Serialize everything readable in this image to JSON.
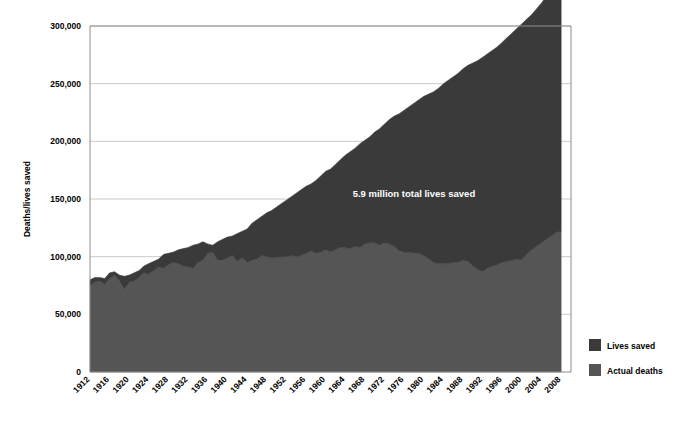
{
  "chart_data": {
    "type": "area",
    "stacked": true,
    "title": "",
    "subtitle": "",
    "xlabel": "",
    "ylabel": "Deaths/lives saved",
    "ylim": [
      0,
      300000
    ],
    "ytick_values": [
      0,
      50000,
      100000,
      150000,
      200000,
      250000,
      300000
    ],
    "ytick_labels": [
      "0",
      "50,000",
      "100,000",
      "150,000",
      "200,000",
      "250,000",
      "300,000"
    ],
    "grid": "horizontal",
    "xlim": [
      1912,
      2010
    ],
    "xtick_labels": [
      "1912",
      "1916",
      "1920",
      "1924",
      "1928",
      "1932",
      "1936",
      "1940",
      "1944",
      "1948",
      "1952",
      "1956",
      "1960",
      "1964",
      "1968",
      "1972",
      "1976",
      "1980",
      "1984",
      "1988",
      "1992",
      "1996",
      "2000",
      "2004",
      "2008"
    ],
    "xtick_values": [
      1912,
      1916,
      1920,
      1924,
      1928,
      1932,
      1936,
      1940,
      1944,
      1948,
      1952,
      1956,
      1960,
      1964,
      1968,
      1972,
      1976,
      1980,
      1984,
      1988,
      1992,
      1996,
      2000,
      2004,
      2008
    ],
    "legend_position": "right",
    "annotations": [
      {
        "text": "5.9 million total lives saved",
        "x": 1978,
        "y": 152000,
        "color": "#ffffff"
      }
    ],
    "x": [
      1912,
      1913,
      1914,
      1915,
      1916,
      1917,
      1918,
      1919,
      1920,
      1921,
      1922,
      1923,
      1924,
      1925,
      1926,
      1927,
      1928,
      1929,
      1930,
      1931,
      1932,
      1933,
      1934,
      1935,
      1936,
      1937,
      1938,
      1939,
      1940,
      1941,
      1942,
      1943,
      1944,
      1945,
      1946,
      1947,
      1948,
      1949,
      1950,
      1951,
      1952,
      1953,
      1954,
      1955,
      1956,
      1957,
      1958,
      1959,
      1960,
      1961,
      1962,
      1963,
      1964,
      1965,
      1966,
      1967,
      1968,
      1969,
      1970,
      1971,
      1972,
      1973,
      1974,
      1975,
      1976,
      1977,
      1978,
      1979,
      1980,
      1981,
      1982,
      1983,
      1984,
      1985,
      1986,
      1987,
      1988,
      1989,
      1990,
      1991,
      1992,
      1993,
      1994,
      1995,
      1996,
      1997,
      1998,
      1999,
      2000,
      2001,
      2002,
      2003,
      2004,
      2005,
      2006,
      2007,
      2008
    ],
    "series": [
      {
        "name": "Actual deaths",
        "color": "#555555",
        "values": [
          75000,
          78000,
          79000,
          76000,
          81000,
          84000,
          79000,
          72000,
          78000,
          79000,
          82000,
          86000,
          85000,
          88000,
          91000,
          90000,
          93000,
          95000,
          94000,
          92000,
          91000,
          90000,
          95000,
          97000,
          103000,
          104000,
          97000,
          97000,
          99000,
          101000,
          96000,
          99000,
          95000,
          97000,
          98000,
          101000,
          100000,
          99000,
          99000,
          100000,
          100000,
          101000,
          100000,
          101000,
          103000,
          105000,
          103000,
          104000,
          106000,
          104000,
          106000,
          108000,
          108000,
          107000,
          109000,
          108000,
          111000,
          112000,
          112000,
          110000,
          112000,
          111000,
          109000,
          105000,
          104000,
          104000,
          103000,
          103000,
          101000,
          98000,
          95000,
          94000,
          94000,
          94000,
          95000,
          95000,
          97000,
          96000,
          92000,
          89000,
          87000,
          90000,
          92000,
          93000,
          95000,
          96000,
          97000,
          98000,
          98000,
          102000,
          106000,
          109000,
          112000,
          115000,
          118000,
          121000,
          122000
        ]
      },
      {
        "name": "Lives saved",
        "color": "#3a3a3a",
        "values": [
          5000,
          4000,
          3000,
          5000,
          5000,
          3000,
          5000,
          11000,
          6000,
          7000,
          6000,
          6000,
          9000,
          8000,
          7000,
          12000,
          10000,
          9000,
          12000,
          15000,
          17000,
          20000,
          16000,
          16000,
          8000,
          6000,
          16000,
          18000,
          18000,
          17000,
          24000,
          23000,
          29000,
          32000,
          34000,
          34000,
          38000,
          41000,
          44000,
          46000,
          49000,
          51000,
          55000,
          57000,
          58000,
          58000,
          63000,
          66000,
          68000,
          72000,
          74000,
          76000,
          80000,
          84000,
          85000,
          90000,
          90000,
          92000,
          96000,
          101000,
          103000,
          108000,
          113000,
          119000,
          123000,
          126000,
          130000,
          133000,
          138000,
          143000,
          148000,
          152000,
          156000,
          159000,
          161000,
          164000,
          166000,
          170000,
          176000,
          181000,
          186000,
          186000,
          187000,
          189000,
          191000,
          194000,
          197000,
          200000,
          204000,
          204000,
          204000,
          206000,
          208000,
          211000,
          214000,
          216000,
          217000
        ]
      }
    ]
  },
  "legend": {
    "items": [
      {
        "label": "Lives saved",
        "color": "#3a3a3a"
      },
      {
        "label": "Actual deaths",
        "color": "#555555"
      }
    ]
  }
}
